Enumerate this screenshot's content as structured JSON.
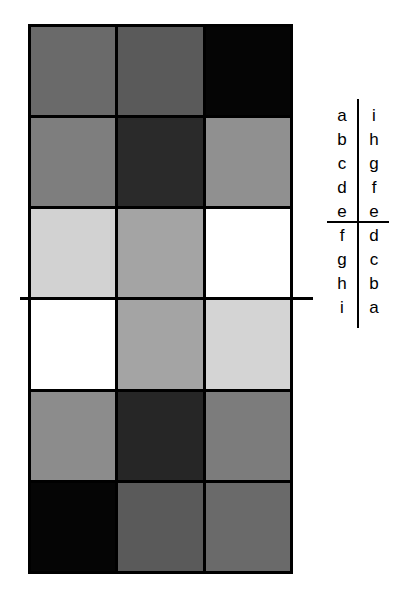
{
  "figure": {
    "grid": {
      "rows": 6,
      "cols": 3,
      "border_color": "#000000",
      "cells": [
        [
          "#6a6a6a",
          "#5a5a5a",
          "#050505"
        ],
        [
          "#7e7e7e",
          "#2a2a2a",
          "#909090"
        ],
        [
          "#d2d2d2",
          "#a4a4a4",
          "#ffffff"
        ],
        [
          "#ffffff",
          "#a4a4a4",
          "#d4d4d4"
        ],
        [
          "#8c8c8c",
          "#262626",
          "#7c7c7c"
        ],
        [
          "#050505",
          "#5a5a5a",
          "#6a6a6a"
        ]
      ]
    },
    "symmetry_line": {
      "orientation": "horizontal",
      "color": "#000000"
    },
    "mapping_table": {
      "left": [
        "a",
        "b",
        "c",
        "d",
        "e",
        "f",
        "g",
        "h",
        "i"
      ],
      "right": [
        "i",
        "h",
        "g",
        "f",
        "e",
        "d",
        "c",
        "b",
        "a"
      ]
    }
  }
}
